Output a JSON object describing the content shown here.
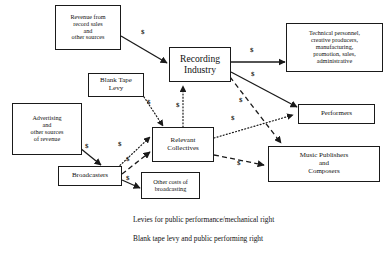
{
  "diagram": {
    "nodes": [
      {
        "id": "revenue",
        "label": "Revenue from\nrecord sales\nand\nother sources"
      },
      {
        "id": "recording",
        "label": "Recording\nIndustry"
      },
      {
        "id": "technical",
        "label": "Technical personnel,\ncreative producers,\nmanufacturing,\npromotion, sales,\nadministrative"
      },
      {
        "id": "performers",
        "label": "Performers"
      },
      {
        "id": "publishers",
        "label": "Music Publishers\nand\nComposers"
      },
      {
        "id": "blanktape",
        "label": "Blank Tape\nLevy"
      },
      {
        "id": "advertising",
        "label": "Advertising\nand\nother sources\nof revenue"
      },
      {
        "id": "collectives",
        "label": "Relevant\nCollectives"
      },
      {
        "id": "broadcasters",
        "label": "Broadcasters"
      },
      {
        "id": "othercosts",
        "label": "Other costs of\nbroadcasting"
      }
    ],
    "edges": [
      {
        "id": "revenue-to-recording",
        "from": "revenue",
        "to": "recording",
        "style": "solid",
        "money": "$"
      },
      {
        "id": "recording-to-technical",
        "from": "recording",
        "to": "technical",
        "style": "solid",
        "money": "$"
      },
      {
        "id": "recording-to-performers",
        "from": "recording",
        "to": "performers",
        "style": "solid",
        "money": "$"
      },
      {
        "id": "recording-to-publishers",
        "from": "recording",
        "to": "publishers",
        "style": "dashed",
        "money": "$"
      },
      {
        "id": "collectives-to-recording",
        "from": "collectives",
        "to": "recording",
        "style": "dotted",
        "money": "$"
      },
      {
        "id": "blanktape-to-collectives",
        "from": "blanktape",
        "to": "collectives",
        "style": "dotted",
        "money": "$"
      },
      {
        "id": "advertising-to-broadcasters",
        "from": "advertising",
        "to": "broadcasters",
        "style": "solid",
        "money": "$"
      },
      {
        "id": "broadcasters-to-collectives-dotted",
        "from": "broadcasters",
        "to": "collectives",
        "style": "dotted",
        "money": "$"
      },
      {
        "id": "broadcasters-to-collectives-dashed",
        "from": "broadcasters",
        "to": "collectives",
        "style": "dashed",
        "money": "$"
      },
      {
        "id": "broadcasters-to-othercosts",
        "from": "broadcasters",
        "to": "othercosts",
        "style": "solid",
        "money": "$"
      },
      {
        "id": "collectives-to-performers",
        "from": "collectives",
        "to": "performers",
        "style": "dotted",
        "money": "$"
      },
      {
        "id": "collectives-to-publishers",
        "from": "collectives",
        "to": "publishers",
        "style": "dashed",
        "money": "$"
      }
    ],
    "money_symbol": "$",
    "legend": [
      {
        "id": "legend-levies",
        "label": "Levies for public performance/mechanical right",
        "style": "dashed"
      },
      {
        "id": "legend-blanktape",
        "label": "Blank tape levy and public performing right",
        "style": "dotted"
      }
    ],
    "colors": {
      "stroke": "#1a1a1a",
      "text": "#111111",
      "background": "#ffffff"
    }
  }
}
